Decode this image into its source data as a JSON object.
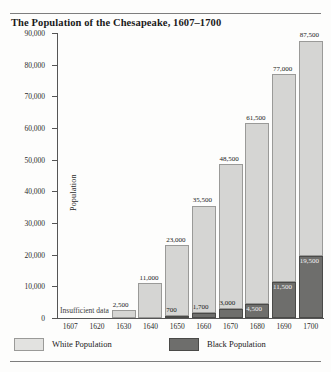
{
  "figure": {
    "title": "The Population of the Chesapeake, 1607–1700",
    "note": "Insufficient data"
  },
  "legend": {
    "items": [
      {
        "label": "White Population",
        "swatch": "light-gray",
        "color": "#d5d5d3"
      },
      {
        "label": "Black Population",
        "swatch": "dark-gray",
        "color": "#6e6e6c"
      }
    ]
  },
  "axes": {
    "ylabel": "Population",
    "yticks": [
      "0",
      "10,000",
      "20,000",
      "30,000",
      "40,000",
      "50,000",
      "60,000",
      "70,000",
      "80,000",
      "90,000"
    ],
    "xticks": [
      "1607",
      "1620",
      "1630",
      "1640",
      "1650",
      "1660",
      "1670",
      "1680",
      "1690",
      "1700"
    ]
  },
  "chart_data": {
    "type": "bar",
    "subtype": "stacked",
    "title": "The Population of the Chesapeake, 1607–1700",
    "xlabel": "",
    "ylabel": "Population",
    "ylim": [
      0,
      90000
    ],
    "ytick_step": 10000,
    "grid": false,
    "legend_position": "bottom-left",
    "categories": [
      "1607",
      "1620",
      "1630",
      "1640",
      "1650",
      "1660",
      "1670",
      "1680",
      "1690",
      "1700"
    ],
    "series": [
      {
        "name": "White Population",
        "color": "#d5d5d3",
        "values": [
          null,
          null,
          2500,
          11000,
          23000,
          35500,
          48500,
          61500,
          77000,
          87500
        ],
        "labels": [
          "",
          "",
          "2,500",
          "11,000",
          "23,000",
          "35,500",
          "48,500",
          "61,500",
          "77,000",
          "87,500"
        ]
      },
      {
        "name": "Black Population",
        "color": "#6e6e6c",
        "values": [
          null,
          null,
          null,
          null,
          700,
          1700,
          3000,
          4500,
          11500,
          19500
        ],
        "labels": [
          "",
          "",
          "",
          "",
          "700",
          "1,700",
          "3,000",
          "4,500",
          "11,500",
          "19,500"
        ]
      }
    ],
    "annotations": [
      {
        "text": "Insufficient data",
        "applies_to": [
          "1607",
          "1620"
        ]
      }
    ]
  }
}
